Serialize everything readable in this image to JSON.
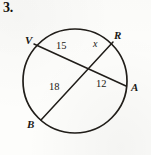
{
  "problem": {
    "number": "3."
  },
  "figure": {
    "type": "circle-with-two-intersecting-chords",
    "shape": {
      "circle": {
        "cx": 75,
        "cy": 81,
        "r": 52
      },
      "stroke_color": "#201d19",
      "background_color": "#fdfdfb"
    },
    "points": [
      {
        "name": "V",
        "label": "V",
        "x": 34,
        "y": 44,
        "label_x": 26,
        "label_y": 36
      },
      {
        "name": "R",
        "label": "R",
        "x": 113,
        "y": 42,
        "label_x": 114,
        "label_y": 31
      },
      {
        "name": "A",
        "label": "A",
        "x": 126,
        "y": 86,
        "label_x": 131,
        "label_y": 84
      },
      {
        "name": "B",
        "label": "B",
        "x": 41,
        "y": 120,
        "label_x": 28,
        "label_y": 121
      }
    ],
    "intersection": {
      "x": 85,
      "y": 68
    },
    "chords": [
      {
        "name": "chord-VA",
        "from": "V",
        "to": "A"
      },
      {
        "name": "chord-RB",
        "from": "R",
        "to": "B"
      }
    ],
    "segment_labels": [
      {
        "name": "segment-15",
        "text": "15",
        "x": 57,
        "y": 45,
        "variable": false
      },
      {
        "name": "segment-x",
        "text": "x",
        "x": 94,
        "y": 42,
        "variable": true
      },
      {
        "name": "segment-12",
        "text": "12",
        "x": 97,
        "y": 83,
        "variable": false
      },
      {
        "name": "segment-18",
        "text": "18",
        "x": 50,
        "y": 85,
        "variable": false
      }
    ]
  }
}
